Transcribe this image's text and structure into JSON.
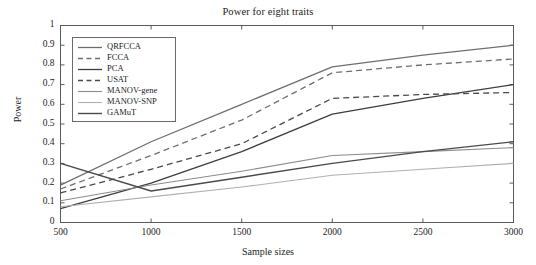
{
  "chart_data": {
    "type": "line",
    "title": "Power for eight traits",
    "xlabel": "Sample sizes",
    "ylabel": "Power",
    "x": [
      500,
      1000,
      1500,
      2000,
      2500,
      3000
    ],
    "xlim": [
      500,
      3000
    ],
    "ylim": [
      0,
      1
    ],
    "xticks": [
      "500",
      "1000",
      "1500",
      "2000",
      "2500",
      "3000"
    ],
    "yticks": [
      "0",
      "0.1",
      "0.2",
      "0.3",
      "0.4",
      "0.5",
      "0.6",
      "0.7",
      "0.8",
      "0.9",
      "1"
    ],
    "grid": false,
    "legend_position": "upper-left-inside",
    "series": [
      {
        "name": "QRFCCA",
        "values": [
          0.19,
          0.41,
          0.6,
          0.79,
          0.85,
          0.9
        ],
        "style": "solid",
        "color": "#6e6e6e",
        "width": 1.3
      },
      {
        "name": "FCCA",
        "values": [
          0.17,
          0.34,
          0.52,
          0.76,
          0.8,
          0.83
        ],
        "style": "dashed",
        "color": "#6e6e6e",
        "width": 1.3
      },
      {
        "name": "PCA",
        "values": [
          0.07,
          0.2,
          0.36,
          0.55,
          0.63,
          0.7
        ],
        "style": "solid",
        "color": "#3d3d3d",
        "width": 1.3
      },
      {
        "name": "USAT",
        "values": [
          0.15,
          0.27,
          0.4,
          0.63,
          0.65,
          0.66
        ],
        "style": "dashed",
        "color": "#4a4a4a",
        "width": 1.3
      },
      {
        "name": "MANOV-gene",
        "values": [
          0.11,
          0.19,
          0.26,
          0.34,
          0.36,
          0.38
        ],
        "style": "solid",
        "color": "#8c8c8c",
        "width": 1.1
      },
      {
        "name": "MANOV-SNP",
        "values": [
          0.08,
          0.13,
          0.18,
          0.24,
          0.27,
          0.3
        ],
        "style": "solid",
        "color": "#b0b0b0",
        "width": 1.1
      },
      {
        "name": "GAMuT",
        "values": [
          0.3,
          0.16,
          0.23,
          0.3,
          0.36,
          0.41
        ],
        "style": "solid",
        "color": "#4a4a4a",
        "width": 1.4
      }
    ],
    "axis_color": "#5a5a5a"
  }
}
